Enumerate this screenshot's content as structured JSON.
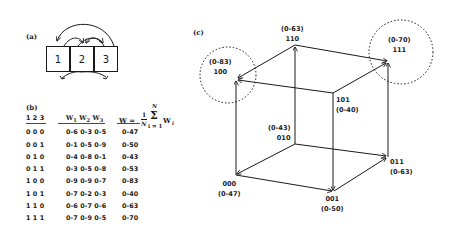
{
  "panels": {
    "a": {
      "label": "(a)",
      "cells": [
        "1",
        "2",
        "3"
      ]
    },
    "b": {
      "label": "(b)",
      "headers": {
        "bits": "1 2 3",
        "w": [
          "W",
          "1",
          "W",
          "2",
          "W",
          "3"
        ],
        "w_text": "W1 W2 W3",
        "avg_lhs": "W =",
        "avg_frac_num": "1",
        "avg_frac_den": "N",
        "avg_sum_top": "N",
        "avg_sum": "Σ",
        "avg_sum_bottom": "i = 1",
        "avg_term": "W",
        "avg_term_sub": "i"
      },
      "rows": [
        {
          "bits": "0 0 0",
          "w": "0-6 0-3 0-5",
          "avg": "0-47"
        },
        {
          "bits": "0 0 1",
          "w": "0-1 0-5 0-9",
          "avg": "0-50"
        },
        {
          "bits": "0 1 0",
          "w": "0-4 0-8 0-1",
          "avg": "0-43"
        },
        {
          "bits": "0 1 1",
          "w": "0-3 0-5 0-8",
          "avg": "0-53"
        },
        {
          "bits": "1 0 0",
          "w": "0-9 0-9 0-7",
          "avg": "0-83"
        },
        {
          "bits": "1 0 1",
          "w": "0-7 0-2 0-3",
          "avg": "0-40"
        },
        {
          "bits": "1 1 0",
          "w": "0-6 0-7 0-6",
          "avg": "0-63"
        },
        {
          "bits": "1 1 1",
          "w": "0-7 0-9 0-5",
          "avg": "0-70"
        }
      ]
    },
    "c": {
      "label": "(c)",
      "vertices": {
        "v000": {
          "code": "000",
          "value": "(0-47)"
        },
        "v001": {
          "code": "001",
          "value": "(0-50)"
        },
        "v010": {
          "code": "010",
          "value": "(0-43)"
        },
        "v011": {
          "code": "011",
          "value": "(0-63)"
        },
        "v100": {
          "code": "100",
          "value": "(0-83)"
        },
        "v101": {
          "code": "101",
          "value": "(0-40)"
        },
        "v110": {
          "code": "110",
          "value": "(0-63)"
        },
        "v111": {
          "code": "111",
          "value": "(0-70)"
        }
      },
      "highlighted_peaks": [
        "100",
        "111"
      ]
    }
  }
}
